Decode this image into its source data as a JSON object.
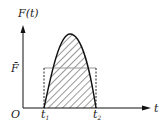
{
  "diagram": {
    "y_axis_label": "F(t)",
    "x_axis_label": "t",
    "origin_label": "O",
    "average_label": "F̄",
    "t1_label": "t",
    "t1_sub": "1",
    "t2_label": "t",
    "t2_sub": "2",
    "colors": {
      "axis": "#111111",
      "curve": "#111111",
      "hatch": "#9a9a9a",
      "average_line": "#999999",
      "dashed": "#222222"
    }
  }
}
